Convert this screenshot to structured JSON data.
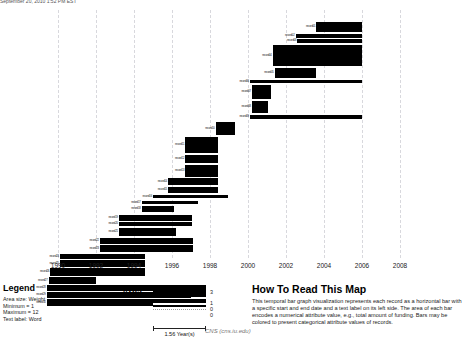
{
  "header": {
    "truncated_text": "September 20, 2010  1:52 PM EST"
  },
  "axis": {
    "ticks": [
      "1990",
      "1992",
      "1994",
      "1996",
      "1998",
      "2000",
      "2002",
      "2004",
      "2006",
      "2008"
    ],
    "x_start_year": 1989.1,
    "x_end_year": 2009.6
  },
  "legend": {
    "title": "Legend",
    "lines": [
      "Area size: Weight",
      "Minimum = 1",
      "Maximum = 12",
      "Text label: Word"
    ]
  },
  "area_legend": {
    "title": "Area",
    "values": [
      "3",
      "1",
      "0",
      "0"
    ],
    "scale_label": "1.56 Year(s)"
  },
  "howto": {
    "title": "How To Read This Map",
    "body": "This temporal bar graph visualization represents each record as a horizontal bar with a specific start and end date and a text label on its left side. The area of each bar encodes a numerical attribute value, e.g., total amount of funding. Bars may be colored to present categorical attribute values of records."
  },
  "credit": "CNS (cns.iu.edu)",
  "chart_data": {
    "type": "bar",
    "chart_kind": "temporal-bar-graph",
    "title": "",
    "xlabel": "",
    "ylabel": "",
    "xlim": [
      1989.1,
      2009.6
    ],
    "grid": true,
    "grid_years": [
      1990,
      1992,
      1994,
      1996,
      1998,
      2000,
      2002,
      2004,
      2006,
      2008
    ],
    "bar_color": "#000000",
    "note": "Each record: start year, end year, bar thickness encodes weight (area size).",
    "records": [
      {
        "label": "record01",
        "start": 2003.6,
        "end": 2006.0,
        "y": 12,
        "h": 10
      },
      {
        "label": "record02",
        "start": 2002.5,
        "end": 2006.0,
        "y": 24,
        "h": 4
      },
      {
        "label": "record03",
        "start": 2002.6,
        "end": 2006.0,
        "y": 29,
        "h": 4
      },
      {
        "label": "record04",
        "start": 2001.3,
        "end": 2006.0,
        "y": 35,
        "h": 21
      },
      {
        "label": "record05",
        "start": 2001.4,
        "end": 2003.6,
        "y": 58,
        "h": 10
      },
      {
        "label": "record06",
        "start": 2000.1,
        "end": 2006.0,
        "y": 70,
        "h": 3
      },
      {
        "label": "record07",
        "start": 2000.2,
        "end": 2001.2,
        "y": 75,
        "h": 14
      },
      {
        "label": "record08",
        "start": 2000.2,
        "end": 2001.05,
        "y": 91,
        "h": 12
      },
      {
        "label": "record09",
        "start": 2000.1,
        "end": 2006.0,
        "y": 105,
        "h": 4
      },
      {
        "label": "record10",
        "start": 1998.3,
        "end": 1999.3,
        "y": 112,
        "h": 13
      },
      {
        "label": "record11",
        "start": 1996.7,
        "end": 1998.4,
        "y": 127,
        "h": 16
      },
      {
        "label": "record12",
        "start": 1996.7,
        "end": 1998.4,
        "y": 145,
        "h": 8
      },
      {
        "label": "record13",
        "start": 1996.7,
        "end": 1998.4,
        "y": 155,
        "h": 12
      },
      {
        "label": "record14",
        "start": 1995.8,
        "end": 1998.4,
        "y": 168,
        "h": 7
      },
      {
        "label": "record15",
        "start": 1995.8,
        "end": 1998.4,
        "y": 177,
        "h": 6
      },
      {
        "label": "record16",
        "start": 1995.0,
        "end": 1998.95,
        "y": 185,
        "h": 3
      },
      {
        "label": "record17",
        "start": 1994.4,
        "end": 1997.35,
        "y": 191,
        "h": 3
      },
      {
        "label": "record18",
        "start": 1994.4,
        "end": 1996.1,
        "y": 196,
        "h": 6
      },
      {
        "label": "record19",
        "start": 1993.2,
        "end": 1997.05,
        "y": 205,
        "h": 6
      },
      {
        "label": "record20",
        "start": 1993.2,
        "end": 1997.05,
        "y": 212,
        "h": 4
      },
      {
        "label": "record21",
        "start": 1993.2,
        "end": 1996.2,
        "y": 218,
        "h": 8
      },
      {
        "label": "record22",
        "start": 1992.2,
        "end": 1997.1,
        "y": 228,
        "h": 6
      },
      {
        "label": "record23",
        "start": 1992.2,
        "end": 1997.1,
        "y": 235,
        "h": 7
      },
      {
        "label": "record24",
        "start": 1990.1,
        "end": 1994.6,
        "y": 244,
        "h": 5
      },
      {
        "label": "record25",
        "start": 1990.1,
        "end": 1994.6,
        "y": 250,
        "h": 7
      },
      {
        "label": "record26",
        "start": 1989.6,
        "end": 1994.6,
        "y": 258,
        "h": 8
      },
      {
        "label": "record27",
        "start": 1989.5,
        "end": 1992.0,
        "y": 267,
        "h": 7
      },
      {
        "label": "record28",
        "start": 1989.4,
        "end": 1997.0,
        "y": 275,
        "h": 6
      },
      {
        "label": "record29",
        "start": 1989.4,
        "end": 1997.0,
        "y": 282,
        "h": 6
      },
      {
        "label": "record30",
        "start": 1989.4,
        "end": 1995.0,
        "y": 289,
        "h": 7
      }
    ]
  }
}
